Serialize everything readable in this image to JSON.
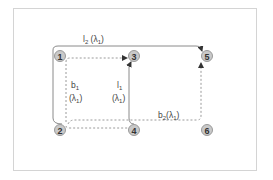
{
  "diagram": {
    "type": "network-lightpath-diagram",
    "colors": {
      "frame": "#d4d4d4",
      "node_fill": "#c9c9c9",
      "node_stroke": "#9a9a9a",
      "solid_path": "#8a8a8a",
      "dashed_path": "#9a9a9a",
      "text": "#444444"
    },
    "nodes": [
      {
        "id": "1",
        "label": "1",
        "x": 60,
        "y": 56
      },
      {
        "id": "3",
        "label": "3",
        "x": 134,
        "y": 56
      },
      {
        "id": "5",
        "label": "5",
        "x": 207,
        "y": 56
      },
      {
        "id": "2",
        "label": "2",
        "x": 60,
        "y": 130
      },
      {
        "id": "4",
        "label": "4",
        "x": 134,
        "y": 130
      },
      {
        "id": "6",
        "label": "6",
        "x": 207,
        "y": 130
      }
    ],
    "paths": [
      {
        "id": "l2",
        "style": "solid",
        "from": "2",
        "to": "5",
        "label_main": "l",
        "label_sub": "2",
        "label_rest": " (λ",
        "label_sub2": "1",
        "label_end": ")"
      },
      {
        "id": "b1",
        "style": "dashed",
        "from": "2",
        "to": "3",
        "label_main": "b",
        "label_sub": "1",
        "label_line2": "(λ",
        "label_sub2": "1",
        "label_end": ")"
      },
      {
        "id": "l1",
        "style": "solid",
        "from": "4",
        "to": "3",
        "label_main": "l",
        "label_sub": "1",
        "label_line2": "(λ",
        "label_sub2": "1",
        "label_end": ")"
      },
      {
        "id": "b2",
        "style": "dashed",
        "from": "2",
        "to": "5",
        "label_main": "b",
        "label_sub": "2",
        "label_rest": "(λ",
        "label_sub2": "1",
        "label_end": ")"
      }
    ]
  }
}
